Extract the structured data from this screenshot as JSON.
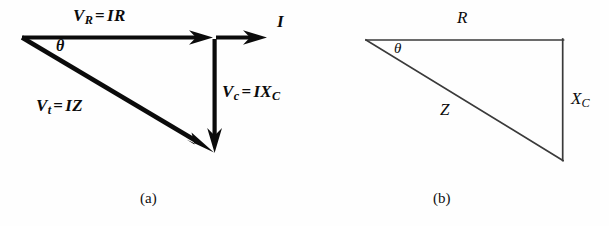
{
  "figure": {
    "title_note": "Phasor diagram and impedance triangle for a series RC circuit",
    "colors": {
      "background": "#fefefe",
      "vector_stroke": "#0b0b0b",
      "triangle_stroke": "#3a3a3a",
      "text": "#0b0b0b"
    },
    "panels": [
      {
        "id": "a",
        "caption": "(a)",
        "type": "phasor-diagram",
        "labels": {
          "resistive_voltage": {
            "symbol": "V",
            "subscript": "R",
            "equals": "=",
            "expression": "IR",
            "full": "V_R = IR"
          },
          "total_voltage": {
            "symbol": "V",
            "subscript": "t",
            "equals": "=",
            "expression": "IZ",
            "full": "V_t = IZ"
          },
          "capacitive_voltage": {
            "symbol": "V",
            "subscript": "c",
            "equals": "=",
            "expression": "IX",
            "expression_subscript": "C",
            "full": "V_c = IX_C"
          },
          "current": "I",
          "angle": "θ"
        },
        "vectors": [
          {
            "name": "V_R",
            "from": [
              22,
              37
            ],
            "to": [
              212,
              37
            ],
            "arrowhead": true,
            "weight": "bold"
          },
          {
            "name": "I",
            "from": [
              215,
              37
            ],
            "to": [
              266,
              37
            ],
            "arrowhead": true,
            "weight": "bold"
          },
          {
            "name": "V_c",
            "from": [
              215,
              40
            ],
            "to": [
              215,
              152
            ],
            "arrowhead": true,
            "weight": "bold"
          },
          {
            "name": "V_t",
            "from": [
              22,
              37
            ],
            "to": [
              215,
              152
            ],
            "arrowhead": true,
            "weight": "bold"
          }
        ]
      },
      {
        "id": "b",
        "caption": "(b)",
        "type": "impedance-triangle",
        "labels": {
          "resistance": "R",
          "impedance": "Z",
          "reactance": {
            "symbol": "X",
            "subscript": "C",
            "full": "X_C"
          },
          "angle": "θ"
        },
        "vertices": {
          "apex": [
            366,
            40
          ],
          "corner": [
            563,
            40
          ],
          "bottom": [
            563,
            160
          ]
        }
      }
    ]
  }
}
